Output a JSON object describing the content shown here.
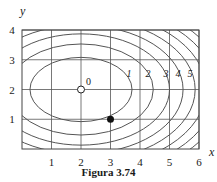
{
  "caption": "Figura 3.74",
  "chart_data": {
    "type": "contour",
    "title": "",
    "caption": "Figura 3.74",
    "xlabel": "x",
    "ylabel": "y",
    "xlim": [
      0,
      6
    ],
    "ylim": [
      0,
      4
    ],
    "grid": true,
    "x_ticks": [
      1,
      2,
      3,
      4,
      5,
      6
    ],
    "y_ticks": [
      1,
      2,
      3,
      4
    ],
    "center": {
      "x": 2,
      "y": 2,
      "label": "0",
      "marker": "open-circle"
    },
    "highlight_point": {
      "x": 3,
      "y": 1,
      "marker": "filled-circle"
    },
    "levels": [
      {
        "label": "1",
        "semi_axis_x": 1.73,
        "semi_axis_y": 1.08
      },
      {
        "label": "2",
        "semi_axis_x": 2.45,
        "semi_axis_y": 1.53
      },
      {
        "label": "3",
        "semi_axis_x": 3.0,
        "semi_axis_y": 1.87
      },
      {
        "label": "4",
        "semi_axis_x": 3.46,
        "semi_axis_y": 2.16
      },
      {
        "label": "5",
        "semi_axis_x": 3.87,
        "semi_axis_y": 2.41
      },
      {
        "label": "",
        "semi_axis_x": 4.24,
        "semi_axis_y": 2.65
      },
      {
        "label": "",
        "semi_axis_x": 4.58,
        "semi_axis_y": 2.86
      },
      {
        "label": "",
        "semi_axis_x": 4.9,
        "semi_axis_y": 3.06
      }
    ],
    "colors": {
      "lines": "#555555",
      "grid": "#555555",
      "point": "#111111"
    }
  }
}
